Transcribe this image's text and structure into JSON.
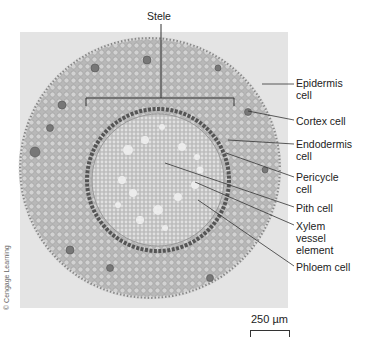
{
  "figure": {
    "title_label": "Stele",
    "labels": [
      {
        "id": "epidermis",
        "text": "Epidermis\ncell",
        "x": 296,
        "y": 77
      },
      {
        "id": "cortex",
        "text": "Cortex cell",
        "x": 296,
        "y": 115
      },
      {
        "id": "endodermis",
        "text": "Endodermis\ncell",
        "x": 296,
        "y": 138
      },
      {
        "id": "pericycle",
        "text": "Pericycle\ncell",
        "x": 296,
        "y": 171
      },
      {
        "id": "pith",
        "text": "Pith cell",
        "x": 296,
        "y": 202
      },
      {
        "id": "xylem",
        "text": "Xylem\nvessel\nelement",
        "x": 296,
        "y": 220
      },
      {
        "id": "phloem",
        "text": "Phloem cell",
        "x": 296,
        "y": 261
      }
    ],
    "scale_bar": "250 µm",
    "credit": "© Cengage Learning"
  },
  "colors": {
    "background": "#ffffff",
    "photo_background": "#e4e4e4",
    "tissue": "#b9b9b9",
    "pith": "#c9c9c9",
    "endodermis_ring": "#555555",
    "leader_line": "#333333"
  }
}
